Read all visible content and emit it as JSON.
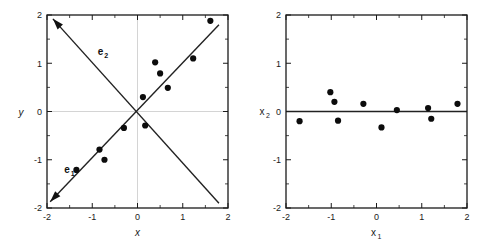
{
  "figure": {
    "title": "",
    "panel_count": 2
  },
  "chart_data": [
    {
      "type": "scatter",
      "panel": "left",
      "title": "",
      "xlabel": "x",
      "ylabel": "y",
      "xlim": [
        -2,
        2
      ],
      "ylim": [
        -2,
        2
      ],
      "xticks": [
        -2,
        -1,
        0,
        1,
        2
      ],
      "yticks": [
        -2,
        -1,
        0,
        1,
        2
      ],
      "xticklabels": [
        "-2",
        "-1",
        "0",
        "1",
        "2"
      ],
      "yticklabels": [
        "-2",
        "-1",
        "0",
        "1",
        "2"
      ],
      "grid": "zero-lines-only",
      "legend": "none",
      "points": [
        {
          "x": -1.35,
          "y": -1.21
        },
        {
          "x": -0.84,
          "y": -0.79
        },
        {
          "x": -0.73,
          "y": -1.0
        },
        {
          "x": -0.3,
          "y": -0.34
        },
        {
          "x": 0.12,
          "y": 0.3
        },
        {
          "x": 0.17,
          "y": -0.29
        },
        {
          "x": 0.39,
          "y": 1.02
        },
        {
          "x": 0.5,
          "y": 0.79
        },
        {
          "x": 0.67,
          "y": 0.49
        },
        {
          "x": 1.23,
          "y": 1.1
        },
        {
          "x": 1.61,
          "y": 1.88
        }
      ],
      "annotations": [
        {
          "name": "e1",
          "label": "e",
          "subscript": "1",
          "type": "eigenvector-arrow",
          "from": [
            1.8,
            1.8
          ],
          "to": [
            -1.93,
            -1.87
          ],
          "label_at": [
            -1.62,
            -1.28
          ]
        },
        {
          "name": "e2",
          "label": "e",
          "subscript": "2",
          "type": "eigenvector-arrow",
          "from": [
            1.8,
            -1.9
          ],
          "to": [
            -1.87,
            1.92
          ],
          "label_at": [
            -0.88,
            1.18
          ]
        }
      ]
    },
    {
      "type": "scatter",
      "panel": "right",
      "title": "",
      "xlabel": "x",
      "xlabel_sub": "1",
      "ylabel": "x",
      "ylabel_sub": "2",
      "xlim": [
        -2,
        2
      ],
      "ylim": [
        -2,
        2
      ],
      "xticks": [
        -2,
        -1,
        0,
        1,
        2
      ],
      "yticks": [
        -2,
        -1,
        0,
        1,
        2
      ],
      "xticklabels": [
        "-2",
        "-1",
        "0",
        "1",
        "2"
      ],
      "yticklabels": [
        "-2",
        "-1",
        "0",
        "1",
        "2"
      ],
      "grid": "none",
      "legend": "none",
      "reference_line": {
        "type": "horizontal",
        "y": 0
      },
      "points": [
        {
          "x": -1.7,
          "y": -0.2
        },
        {
          "x": -1.02,
          "y": 0.4
        },
        {
          "x": -0.93,
          "y": 0.2
        },
        {
          "x": -0.85,
          "y": -0.19
        },
        {
          "x": -0.29,
          "y": 0.16
        },
        {
          "x": 0.11,
          "y": -0.33
        },
        {
          "x": 0.45,
          "y": 0.03
        },
        {
          "x": 1.14,
          "y": 0.07
        },
        {
          "x": 1.21,
          "y": -0.15
        },
        {
          "x": 1.79,
          "y": 0.16
        }
      ]
    }
  ]
}
